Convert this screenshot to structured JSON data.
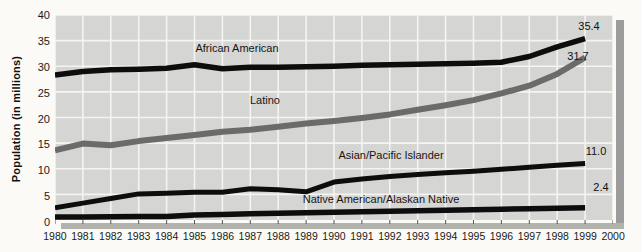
{
  "colors": {
    "page_background": "#fbfaf6",
    "plot_background": "#d5d5d3",
    "gridline": "#f4f4f2",
    "line_black": "#0d0d0d",
    "line_gray": "#6b6b6b",
    "shadow_right": "#9c9c9c",
    "shadow_bottom": "#b3b3ae",
    "tick_mark": "#555555"
  },
  "y_axis": {
    "title": "Population (in millions)",
    "tick_labels": [
      "40",
      "35",
      "30",
      "25",
      "20",
      "15",
      "10",
      "5",
      "0"
    ]
  },
  "x_axis": {
    "tick_labels": [
      "1980",
      "1981",
      "1982",
      "1983",
      "1984",
      "1985",
      "1986",
      "1987",
      "1988",
      "1989",
      "1990",
      "1991",
      "1992",
      "1993",
      "1994",
      "1995",
      "1996",
      "1997",
      "1998",
      "1999",
      "2000"
    ]
  },
  "chart_data": {
    "type": "line",
    "title": "",
    "xlabel": "",
    "ylabel": "Population (in millions)",
    "xlim": [
      1980,
      2000
    ],
    "ylim": [
      0,
      40
    ],
    "ytick_interval": 5,
    "grid": true,
    "legend_position": "labels-inline",
    "x": [
      1980,
      1981,
      1982,
      1983,
      1984,
      1985,
      1986,
      1987,
      1988,
      1989,
      1990,
      1991,
      1992,
      1993,
      1994,
      1995,
      1996,
      1997,
      1998,
      1999
    ],
    "series": [
      {
        "name": "African American",
        "color": "#0d0d0d",
        "stroke_width": 5.5,
        "end_label": "35.4",
        "values": [
          28.3,
          29.0,
          29.3,
          29.4,
          29.6,
          30.3,
          29.5,
          29.8,
          29.8,
          29.9,
          30.0,
          30.2,
          30.3,
          30.4,
          30.5,
          30.6,
          30.8,
          31.9,
          33.8,
          35.4
        ]
      },
      {
        "name": "Latino",
        "color": "#6b6b6b",
        "stroke_width": 6,
        "end_label": "31.7",
        "values": [
          13.6,
          14.9,
          14.6,
          15.4,
          16.0,
          16.6,
          17.2,
          17.6,
          18.2,
          18.8,
          19.3,
          19.9,
          20.6,
          21.5,
          22.4,
          23.4,
          24.7,
          26.2,
          28.5,
          31.7
        ]
      },
      {
        "name": "Asian/Pacific Islander",
        "color": "#0d0d0d",
        "stroke_width": 5,
        "end_label": "11.0",
        "values": [
          2.4,
          3.3,
          4.2,
          5.1,
          5.2,
          5.4,
          5.4,
          6.1,
          5.9,
          5.5,
          7.4,
          8.0,
          8.5,
          8.9,
          9.2,
          9.5,
          9.9,
          10.3,
          10.7,
          11.0
        ]
      },
      {
        "name": "Native American/Alaskan Native",
        "color": "#0d0d0d",
        "stroke_width": 5.5,
        "end_label": "2.4",
        "values": [
          0.6,
          0.6,
          0.65,
          0.7,
          0.7,
          1.0,
          1.1,
          1.2,
          1.3,
          1.4,
          1.5,
          1.6,
          1.7,
          1.8,
          1.9,
          2.0,
          2.1,
          2.2,
          2.3,
          2.4
        ]
      }
    ]
  }
}
